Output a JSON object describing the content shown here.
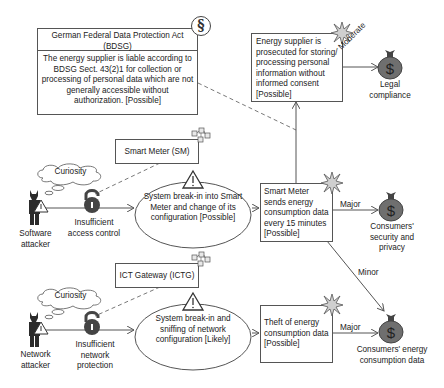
{
  "legal": {
    "title": "German Federal Data Protection Act (BDSG)",
    "body": "The energy supplier is liable according to BDSG Sect. 43(2)1 for collection or processing of personal data which are not generally accessible without authorization. [Possible]",
    "icon": "paragraph-icon"
  },
  "legal_consequence": {
    "text": "Energy supplier is prosecuted for storing/ processing personal information without informed consent [Possible]"
  },
  "components": [
    {
      "label": "Smart Meter (SM)",
      "icon": "component-network-icon"
    },
    {
      "label": "ICT Gateway (ICTG)",
      "icon": "component-network-icon"
    }
  ],
  "attackers": [
    {
      "label": "Software attacker",
      "motivation": "Curiosity",
      "vulnerability": "Insufficient access control",
      "threat": "System break-in into Smart Meter and change of its configuration [Possible]"
    },
    {
      "label": "Network attacker",
      "motivation": "Curiosity",
      "vulnerability": "Insufficient network protection",
      "threat": "System break-in and sniffing of network configuration [Likely]"
    }
  ],
  "incidents": [
    {
      "text": "Smart Meter sends energy consumption data every 15 minutes [Possible]"
    },
    {
      "text": "Theft of energy consumption data [Possible]"
    }
  ],
  "assets": [
    {
      "label": "Legal compliance",
      "icon": "money-bag-icon"
    },
    {
      "label": "Consumers' security and privacy",
      "icon": "money-bag-icon"
    },
    {
      "label": "Consumers' energy consumption data",
      "icon": "money-bag-icon"
    }
  ],
  "consequences": {
    "legal": "Moderate",
    "security": "Major",
    "data_minor": "Minor",
    "data_major": "Major"
  },
  "colors": {
    "line": "#555555",
    "icon_dark": "#4a4a4a",
    "bag": "#6f6f6f",
    "star": "#cfcfcf"
  }
}
